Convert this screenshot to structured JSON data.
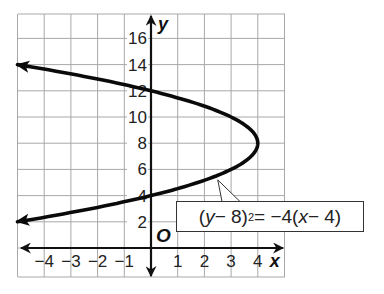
{
  "chart_data": {
    "type": "line",
    "title": "",
    "xlabel": "x",
    "ylabel": "y",
    "origin_label": "O",
    "xlim": [
      -5,
      5
    ],
    "ylim": [
      -1,
      18
    ],
    "grid": true,
    "grid_x_step": 1,
    "grid_y_step": 2,
    "x_ticks": [
      -4,
      -3,
      -2,
      -1,
      1,
      2,
      3,
      4
    ],
    "x_tick_labels": [
      "−4",
      "−3",
      "−2",
      "−1",
      "1",
      "2",
      "3",
      "4"
    ],
    "y_ticks": [
      2,
      4,
      6,
      8,
      10,
      12,
      14,
      16
    ],
    "y_tick_labels": [
      "2",
      "4",
      "6",
      "8",
      "10",
      "12",
      "14",
      "16"
    ],
    "series": [
      {
        "name": "(y − 8)² = −4(x − 4)",
        "kind": "parabola-opening-left",
        "vertex": [
          4,
          8
        ],
        "y_range": [
          2,
          14
        ],
        "arrows": [
          "start",
          "end"
        ],
        "points": [
          [
            -5,
            2
          ],
          [
            -3,
            3.53
          ],
          [
            -1,
            3.53
          ],
          [
            -1,
            3.53
          ],
          [
            -2.25,
            3
          ],
          [
            0,
            4
          ],
          [
            1.75,
            5
          ],
          [
            3,
            6
          ],
          [
            3.75,
            7
          ],
          [
            4,
            8
          ],
          [
            3.75,
            9
          ],
          [
            3,
            10
          ],
          [
            1.75,
            11
          ],
          [
            0,
            12
          ],
          [
            -2.25,
            13
          ],
          [
            -5,
            14
          ]
        ],
        "key_points": {
          "vertex": [
            4,
            8
          ],
          "y_intercepts": [
            [
              0,
              4
            ],
            [
              0,
              12
            ]
          ],
          "arrow_ends": [
            [
              -5,
              2
            ],
            [
              -5,
              14
            ]
          ]
        }
      }
    ],
    "annotations": [
      {
        "text_parts": {
          "open": "(",
          "var_y": "y",
          "minus1": " − 8)",
          "exp": "2",
          "mid": " = −4(",
          "var_x": "x",
          "end": " − 4)"
        },
        "points_to": [
          2.5,
          5.2
        ]
      }
    ]
  },
  "colors": {
    "curve": "#0a0a0a",
    "grid": "#a8a8a8",
    "axes": "#111111",
    "background": "#ffffff"
  }
}
